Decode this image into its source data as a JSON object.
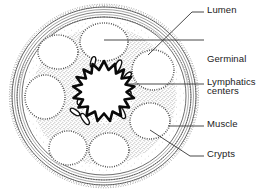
{
  "figure": {
    "colors": {
      "ink": "#1a1a1a",
      "outline": "#2b2b2b",
      "stipple": "#3a3a3a",
      "background": "#ffffff",
      "leader": "#333333"
    },
    "structures": [
      {
        "name": "lumen",
        "description": "central star-shaped lumen with thick irregular black outline"
      },
      {
        "name": "germinal-centers",
        "description": "ring of pale oval lymphoid follicles with dense stippled rims"
      },
      {
        "name": "lymphatics",
        "description": "small elongated lens-shaped vessels near the central lumen"
      },
      {
        "name": "muscle",
        "description": "concentric smooth banded layers forming the outer wall"
      },
      {
        "name": "crypts",
        "description": "finely scalloped serrated inner epithelial border"
      }
    ]
  },
  "labels": [
    {
      "id": "lumen",
      "text": "Lumen",
      "lines": [
        "Lumen"
      ],
      "text_x": 207,
      "text_y": 7,
      "leader": {
        "points": [
          [
            204,
            12
          ],
          [
            192,
            12
          ],
          [
            148,
            55
          ]
        ]
      }
    },
    {
      "id": "germinal-centers",
      "text": "Germinal centers",
      "lines": [
        "Germinal",
        "centers"
      ],
      "text_x": 207,
      "text_y": 35,
      "leader": {
        "points": [
          [
            204,
            40
          ],
          [
            104,
            40
          ]
        ]
      }
    },
    {
      "id": "lymphatics",
      "text": "Lymphatics",
      "lines": [
        "Lymphatics"
      ],
      "text_x": 207,
      "text_y": 79,
      "leader": {
        "points": [
          [
            204,
            84
          ],
          [
            128,
            84
          ]
        ]
      }
    },
    {
      "id": "muscle",
      "text": "Muscle",
      "lines": [
        "Muscle"
      ],
      "text_x": 207,
      "text_y": 121,
      "leader": {
        "points": [
          [
            204,
            126
          ],
          [
            168,
            126
          ]
        ]
      }
    },
    {
      "id": "crypts",
      "text": "Crypts",
      "lines": [
        "Crypts"
      ],
      "text_x": 207,
      "text_y": 151,
      "leader": {
        "points": [
          [
            204,
            156
          ],
          [
            190,
            156
          ],
          [
            150,
            130
          ]
        ]
      }
    }
  ]
}
